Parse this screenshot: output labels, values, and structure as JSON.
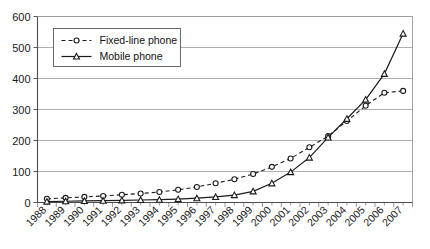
{
  "chart_data": {
    "type": "line",
    "title": "",
    "subtitle": "",
    "xlabel": "",
    "ylabel": "",
    "ylim": [
      0,
      600
    ],
    "ytick_values": [
      0,
      100,
      200,
      300,
      400,
      500,
      600
    ],
    "ytick_labels": [
      "0",
      "100",
      "200",
      "300",
      "400",
      "500",
      "600"
    ],
    "grid": true,
    "legend_position": "top-left-inside",
    "categories": [
      "1988",
      "1989",
      "1990",
      "1991",
      "1992",
      "1993",
      "1994",
      "1995",
      "1996",
      "1997",
      "1998",
      "1999",
      "2000",
      "2001",
      "2002",
      "2003",
      "2004",
      "2005",
      "2006",
      "2007"
    ],
    "series": [
      {
        "name": "Fixed-line phone",
        "marker": "circle",
        "line_style": "dashed",
        "color": "#1a1a1a",
        "values": [
          12,
          15,
          18,
          21,
          25,
          29,
          34,
          41,
          50,
          62,
          75,
          92,
          115,
          142,
          178,
          214,
          263,
          312,
          354,
          360
        ]
      },
      {
        "name": "Mobile phone",
        "marker": "triangle",
        "line_style": "solid",
        "color": "#1a1a1a",
        "values": [
          3,
          4,
          5,
          6,
          7,
          8,
          9,
          11,
          14,
          18,
          24,
          36,
          62,
          98,
          145,
          210,
          270,
          332,
          415,
          545
        ]
      }
    ],
    "annotations": []
  },
  "legend": {
    "items": [
      {
        "label": "Fixed-line phone",
        "marker": "circle-marker",
        "style": "dashed"
      },
      {
        "label": "Mobile phone",
        "marker": "triangle-marker",
        "style": "solid"
      }
    ]
  },
  "colors": {
    "background": "#ffffff",
    "ink": "#1a1a1a",
    "grid": "#9a9a9a",
    "axis": "#4d4d4d"
  }
}
